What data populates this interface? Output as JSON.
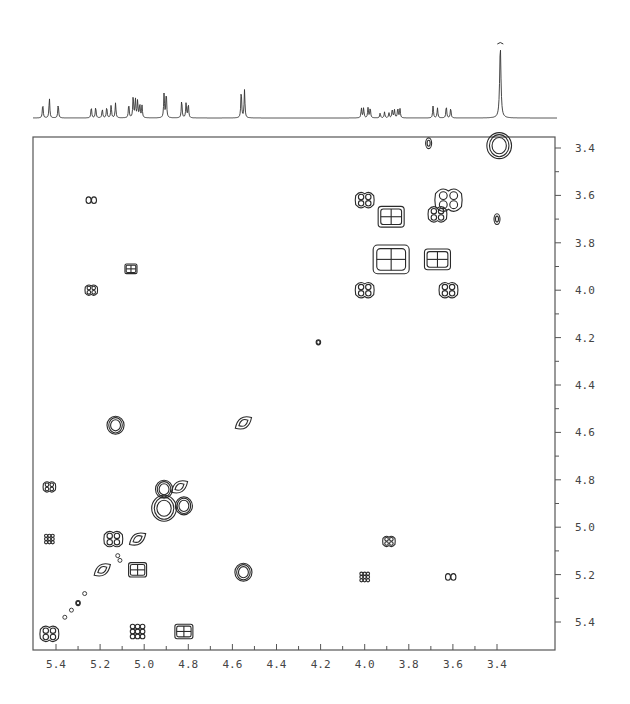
{
  "chart_data": {
    "type": "heatmap",
    "subtype": "2D NMR COSY contour plot with 1D projection",
    "title": "",
    "xlabel": "",
    "ylabel": "",
    "x_unit": "ppm",
    "y_unit": "ppm",
    "xlim": [
      5.5,
      3.3
    ],
    "ylim": [
      3.35,
      5.5
    ],
    "x_ticks": [
      "5.4",
      "5.2",
      "5.0",
      "4.8",
      "4.6",
      "4.4",
      "4.2",
      "4.0",
      "3.8",
      "3.6",
      "3.4"
    ],
    "y_ticks": [
      "3.4",
      "3.6",
      "3.8",
      "4.0",
      "4.2",
      "4.4",
      "4.6",
      "4.8",
      "5.0",
      "5.2",
      "5.4"
    ],
    "grid": false,
    "legend": null,
    "projection_1d": {
      "peaks": [
        {
          "ppm": 5.46,
          "height": 14
        },
        {
          "ppm": 5.43,
          "height": 20
        },
        {
          "ppm": 5.39,
          "height": 14
        },
        {
          "ppm": 5.24,
          "height": 11
        },
        {
          "ppm": 5.22,
          "height": 11
        },
        {
          "ppm": 5.19,
          "height": 9
        },
        {
          "ppm": 5.17,
          "height": 11
        },
        {
          "ppm": 5.15,
          "height": 13
        },
        {
          "ppm": 5.13,
          "height": 15
        },
        {
          "ppm": 5.07,
          "height": 14
        },
        {
          "ppm": 5.05,
          "height": 22
        },
        {
          "ppm": 5.04,
          "height": 19
        },
        {
          "ppm": 5.03,
          "height": 17
        },
        {
          "ppm": 5.02,
          "height": 14
        },
        {
          "ppm": 5.01,
          "height": 12
        },
        {
          "ppm": 4.91,
          "height": 24
        },
        {
          "ppm": 4.9,
          "height": 26
        },
        {
          "ppm": 4.83,
          "height": 18
        },
        {
          "ppm": 4.81,
          "height": 15
        },
        {
          "ppm": 4.8,
          "height": 14
        },
        {
          "ppm": 4.56,
          "height": 28
        },
        {
          "ppm": 4.545,
          "height": 28
        },
        {
          "ppm": 4.015,
          "height": 10
        },
        {
          "ppm": 4.005,
          "height": 10
        },
        {
          "ppm": 3.985,
          "height": 10
        },
        {
          "ppm": 3.975,
          "height": 10
        },
        {
          "ppm": 3.93,
          "height": 5
        },
        {
          "ppm": 3.91,
          "height": 6
        },
        {
          "ppm": 3.89,
          "height": 5
        },
        {
          "ppm": 3.875,
          "height": 9
        },
        {
          "ppm": 3.865,
          "height": 8
        },
        {
          "ppm": 3.85,
          "height": 10
        },
        {
          "ppm": 3.84,
          "height": 9
        },
        {
          "ppm": 3.69,
          "height": 12
        },
        {
          "ppm": 3.67,
          "height": 10
        },
        {
          "ppm": 3.63,
          "height": 12
        },
        {
          "ppm": 3.61,
          "height": 10
        },
        {
          "ppm": 3.385,
          "height": 72
        }
      ]
    },
    "cross_peaks": [
      {
        "x": 3.39,
        "y": 3.39,
        "shape": "ring",
        "size": "large"
      },
      {
        "x": 3.71,
        "y": 3.38,
        "shape": "blob",
        "size": "small"
      },
      {
        "x": 3.62,
        "y": 3.62,
        "shape": "cluster",
        "size": "large"
      },
      {
        "x": 3.67,
        "y": 3.68,
        "shape": "cluster",
        "size": "medium"
      },
      {
        "x": 3.4,
        "y": 3.7,
        "shape": "blob",
        "size": "small"
      },
      {
        "x": 4.0,
        "y": 3.62,
        "shape": "cluster",
        "size": "medium"
      },
      {
        "x": 3.88,
        "y": 3.69,
        "shape": "box",
        "size": "large"
      },
      {
        "x": 3.88,
        "y": 3.87,
        "shape": "box",
        "size": "xlarge"
      },
      {
        "x": 3.67,
        "y": 3.87,
        "shape": "box",
        "size": "large"
      },
      {
        "x": 3.62,
        "y": 4.0,
        "shape": "cluster",
        "size": "medium"
      },
      {
        "x": 4.0,
        "y": 4.0,
        "shape": "cluster",
        "size": "medium"
      },
      {
        "x": 5.24,
        "y": 3.62,
        "shape": "double",
        "size": "small"
      },
      {
        "x": 5.24,
        "y": 4.0,
        "shape": "cluster",
        "size": "small"
      },
      {
        "x": 5.06,
        "y": 3.91,
        "shape": "box",
        "size": "small"
      },
      {
        "x": 4.21,
        "y": 4.22,
        "shape": "ring",
        "size": "tiny"
      },
      {
        "x": 5.13,
        "y": 4.57,
        "shape": "ring",
        "size": "medium"
      },
      {
        "x": 4.55,
        "y": 4.56,
        "shape": "diamond",
        "size": "medium"
      },
      {
        "x": 5.43,
        "y": 4.83,
        "shape": "cluster",
        "size": "small"
      },
      {
        "x": 4.91,
        "y": 4.84,
        "shape": "ring",
        "size": "medium"
      },
      {
        "x": 4.84,
        "y": 4.83,
        "shape": "diamond",
        "size": "medium"
      },
      {
        "x": 4.91,
        "y": 4.92,
        "shape": "ring",
        "size": "large"
      },
      {
        "x": 4.82,
        "y": 4.91,
        "shape": "ring",
        "size": "medium"
      },
      {
        "x": 5.43,
        "y": 5.05,
        "shape": "grid",
        "size": "small"
      },
      {
        "x": 5.14,
        "y": 5.05,
        "shape": "cluster",
        "size": "medium"
      },
      {
        "x": 5.03,
        "y": 5.05,
        "shape": "diamond",
        "size": "medium"
      },
      {
        "x": 3.89,
        "y": 5.06,
        "shape": "cluster",
        "size": "small"
      },
      {
        "x": 5.03,
        "y": 5.18,
        "shape": "box",
        "size": "medium"
      },
      {
        "x": 4.55,
        "y": 5.19,
        "shape": "ring",
        "size": "medium"
      },
      {
        "x": 5.19,
        "y": 5.18,
        "shape": "diamond",
        "size": "medium"
      },
      {
        "x": 4.0,
        "y": 5.21,
        "shape": "grid",
        "size": "small"
      },
      {
        "x": 3.61,
        "y": 5.21,
        "shape": "double",
        "size": "small"
      },
      {
        "x": 5.3,
        "y": 5.32,
        "shape": "ring",
        "size": "tiny"
      },
      {
        "x": 5.43,
        "y": 5.45,
        "shape": "cluster",
        "size": "medium"
      },
      {
        "x": 5.03,
        "y": 5.44,
        "shape": "grid",
        "size": "medium"
      },
      {
        "x": 4.82,
        "y": 5.44,
        "shape": "box",
        "size": "medium"
      }
    ]
  },
  "axes": {
    "x_ticks": [
      {
        "label": "5.4",
        "ppm": 5.4
      },
      {
        "label": "5.2",
        "ppm": 5.2
      },
      {
        "label": "5.0",
        "ppm": 5.0
      },
      {
        "label": "4.8",
        "ppm": 4.8
      },
      {
        "label": "4.6",
        "ppm": 4.6
      },
      {
        "label": "4.4",
        "ppm": 4.4
      },
      {
        "label": "4.2",
        "ppm": 4.2
      },
      {
        "label": "4.0",
        "ppm": 4.0
      },
      {
        "label": "3.8",
        "ppm": 3.8
      },
      {
        "label": "3.6",
        "ppm": 3.6
      },
      {
        "label": "3.4",
        "ppm": 3.4
      }
    ],
    "y_ticks": [
      {
        "label": "3.4",
        "ppm": 3.4
      },
      {
        "label": "3.6",
        "ppm": 3.6
      },
      {
        "label": "3.8",
        "ppm": 3.8
      },
      {
        "label": "4.0",
        "ppm": 4.0
      },
      {
        "label": "4.2",
        "ppm": 4.2
      },
      {
        "label": "4.4",
        "ppm": 4.4
      },
      {
        "label": "4.6",
        "ppm": 4.6
      },
      {
        "label": "4.8",
        "ppm": 4.8
      },
      {
        "label": "5.0",
        "ppm": 5.0
      },
      {
        "label": "5.2",
        "ppm": 5.2
      },
      {
        "label": "5.4",
        "ppm": 5.4
      }
    ]
  },
  "caption": {
    "text": ""
  },
  "style": {
    "line_color": "#333333",
    "frame_color": "#555555",
    "contour_color": "#2a2a2a"
  }
}
